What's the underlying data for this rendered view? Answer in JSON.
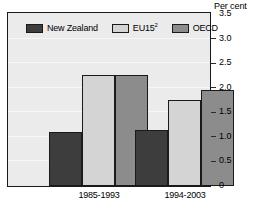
{
  "chart_data": {
    "type": "bar",
    "title": "",
    "axis_title": "Per cent",
    "xlabel": "",
    "ylabel": "Per cent",
    "categories": [
      "1985-1993",
      "1994-2003"
    ],
    "series": [
      {
        "name": "New Zealand",
        "color": "#3d3d3d",
        "values": [
          1.1,
          1.15
        ]
      },
      {
        "name": "EU15²",
        "color": "#d4d4d4",
        "values": [
          2.25,
          1.75
        ]
      },
      {
        "name": "OECD",
        "color": "#8c8c8c",
        "values": [
          2.25,
          1.95
        ]
      }
    ],
    "legend": [
      {
        "label": "New Zealand",
        "swatch": "#3d3d3d"
      },
      {
        "label_text": "EU15",
        "label_sup": "2",
        "swatch": "#d4d4d4"
      },
      {
        "label": "OECD",
        "swatch": "#8c8c8c"
      }
    ],
    "ylim": [
      0,
      3.5
    ],
    "ytick_values": [
      "3.5",
      "3.0",
      "2.5",
      "2.0",
      "1.5",
      "1.0",
      "0.5",
      "0"
    ],
    "grid": true,
    "legend_position": "inside-top-left",
    "plot_background": "#ebebeb",
    "frame_color": "#1a1a1a"
  }
}
